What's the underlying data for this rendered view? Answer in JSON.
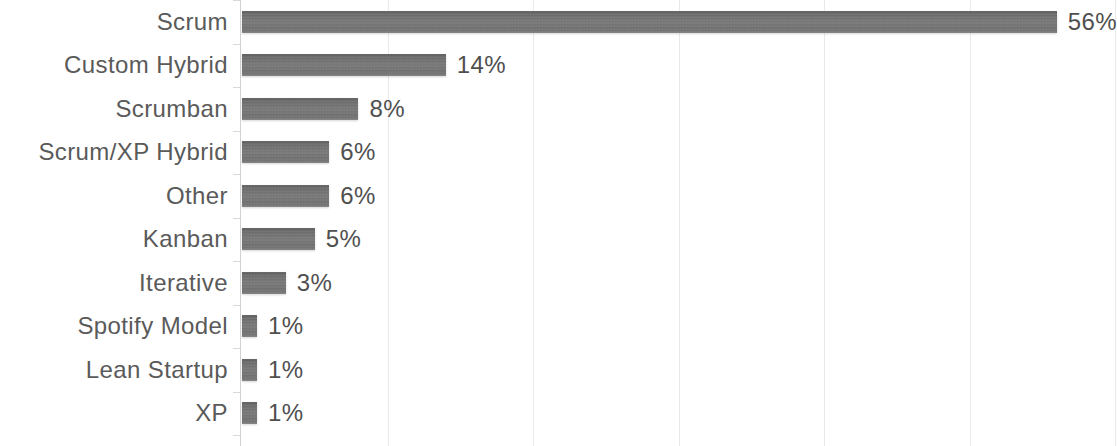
{
  "chart_data": {
    "type": "bar",
    "orientation": "horizontal",
    "title": "",
    "subtitle": "",
    "xlabel": "",
    "ylabel": "",
    "categories": [
      "Scrum",
      "Custom Hybrid",
      "Scrumban",
      "Scrum/XP Hybrid",
      "Other",
      "Kanban",
      "Iterative",
      "Spotify Model",
      "Lean Startup",
      "XP"
    ],
    "values": [
      56,
      14,
      8,
      6,
      6,
      5,
      3,
      1,
      1,
      1
    ],
    "value_labels": [
      "56%",
      "14%",
      "8%",
      "6%",
      "6%",
      "5%",
      "3%",
      "1%",
      "1%",
      "1%"
    ],
    "unit": "%",
    "xlim": [
      0,
      60
    ],
    "xticks": [
      0,
      10,
      20,
      30,
      40,
      50,
      60
    ],
    "xtick_labels": [],
    "grid": true,
    "grid_axis": "x",
    "legend": false,
    "legend_position": "none",
    "bar_color": "#6f6f6f",
    "grid_color": "#e9e9e9",
    "axis_color": "#d2d2d2",
    "label_color": "#5a5a5a",
    "value_color": "#4f4f4f",
    "background_color": "#ffffff"
  },
  "layout": {
    "plot_left_px": 242,
    "px_per_unit": 14.55,
    "row_pitch_px": 43.5,
    "bar_height_px": 22,
    "first_row_top_px": 0
  }
}
